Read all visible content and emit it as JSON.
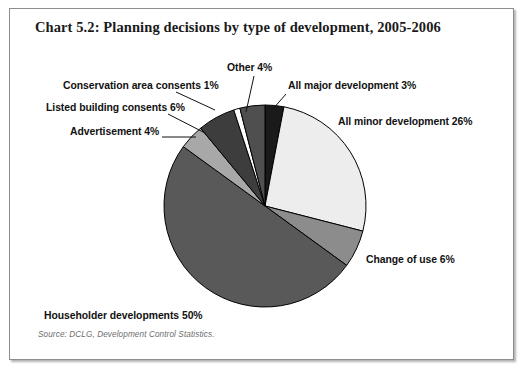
{
  "title": "Chart 5.2: Planning decisions by type of development, 2005-2006",
  "source": "Source: DCLG, Development Control Statistics.",
  "labels": {
    "conservation": "Conservation area consents 1%",
    "listed": "Listed building consents 6%",
    "advertisement": "Advertisement 4%",
    "other": "Other 4%",
    "major": "All major development 3%",
    "minor": "All minor development 26%",
    "change": "Change of use 6%",
    "householder": "Householder developments 50%"
  },
  "chart_data": {
    "type": "pie",
    "title": "Chart 5.2: Planning decisions by type of development, 2005-2006",
    "xlabel": "",
    "ylabel": "",
    "units": "percent",
    "legend_position": "none-labels-outside",
    "grid": false,
    "start_angle_deg": 0,
    "direction": "clockwise",
    "categories": [
      "All major development",
      "All minor development",
      "Change of use",
      "Householder developments",
      "Advertisement",
      "Listed building consents",
      "Conservation area consents",
      "Other"
    ],
    "values": [
      3,
      26,
      6,
      50,
      4,
      6,
      1,
      4
    ],
    "slices": [
      {
        "label": "All major development 3%",
        "name": "All major development",
        "value": 3,
        "color": "#1a1a1a"
      },
      {
        "label": "All minor development 26%",
        "name": "All minor development",
        "value": 26,
        "color": "#ededed"
      },
      {
        "label": "Change of use 6%",
        "name": "Change of use",
        "value": 6,
        "color": "#8c8c8c"
      },
      {
        "label": "Householder developments 50%",
        "name": "Householder developments",
        "value": 50,
        "color": "#595959"
      },
      {
        "label": "Advertisement 4%",
        "name": "Advertisement",
        "value": 4,
        "color": "#a8a8a8"
      },
      {
        "label": "Listed building consents 6%",
        "name": "Listed building consents",
        "value": 6,
        "color": "#3d3d3d"
      },
      {
        "label": "Conservation area consents 1%",
        "name": "Conservation area consents",
        "value": 1,
        "color": "#ffffff"
      },
      {
        "label": "Other 4%",
        "name": "Other",
        "value": 4,
        "color": "#4f4f4f"
      }
    ]
  },
  "geometry": {
    "cx": 265,
    "cy": 206,
    "r": 101
  },
  "colors": {
    "frame_border": "#8d8d8d",
    "slice_outline": "#000000",
    "leader_line": "#111111",
    "title_text": "#1a1a1a",
    "source_text": "#6e6e6e"
  }
}
